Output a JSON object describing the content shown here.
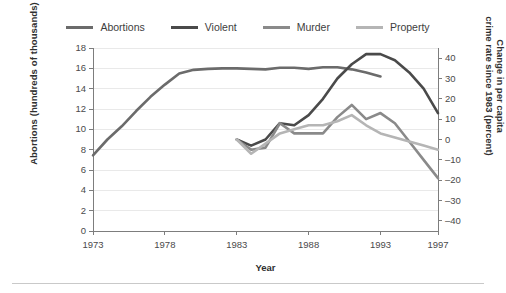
{
  "chart_data": {
    "type": "line",
    "title": "",
    "xlabel": "Year",
    "ylabel": "Abortions (hundreds of thousands)",
    "ylabel_right_line1": "Change in per capita",
    "ylabel_right_line2": "crime rate since 1983 (percent)",
    "grid": true,
    "legend_position": "top",
    "xlim": [
      1973,
      1997
    ],
    "xticks": [
      1973,
      1978,
      1983,
      1988,
      1993,
      1997
    ],
    "xticklabels": [
      "1973",
      "1978",
      "1983",
      "1988",
      "1993",
      "1997"
    ],
    "ylim_left": [
      0,
      18
    ],
    "yticks_left": [
      0,
      2,
      4,
      6,
      8,
      10,
      12,
      14,
      16,
      18
    ],
    "yticklabels_left": [
      "0",
      "2",
      "4",
      "6",
      "8",
      "10",
      "12",
      "14",
      "16",
      "18"
    ],
    "ylim_right": [
      -45,
      45
    ],
    "yticks_right": [
      40,
      30,
      20,
      10,
      0,
      -10,
      -20,
      -30,
      -40
    ],
    "yticklabels_right": [
      "40",
      "30",
      "20",
      "10",
      "0",
      "–10",
      "–20",
      "–30",
      "–40"
    ],
    "series": [
      {
        "name": "Abortions",
        "axis": "left",
        "color": "#6b6b6b",
        "width": 2.6,
        "x": [
          1973,
          1974,
          1975,
          1976,
          1977,
          1978,
          1979,
          1980,
          1981,
          1982,
          1983,
          1984,
          1985,
          1986,
          1987,
          1988,
          1989,
          1990,
          1991,
          1992,
          1993
        ],
        "y": [
          7.45,
          9.0,
          10.3,
          11.8,
          13.2,
          14.4,
          15.5,
          15.85,
          15.95,
          16.0,
          16.0,
          15.95,
          15.9,
          16.05,
          16.05,
          15.95,
          16.1,
          16.1,
          15.9,
          15.6,
          15.2
        ]
      },
      {
        "name": "Violent",
        "axis": "right",
        "color": "#4a4a4a",
        "width": 2.6,
        "x": [
          1983,
          1984,
          1985,
          1986,
          1987,
          1988,
          1989,
          1990,
          1991,
          1992,
          1993,
          1994,
          1995,
          1996,
          1997
        ],
        "y": [
          0,
          -3,
          0,
          8,
          7,
          12,
          20,
          30,
          37,
          42,
          42,
          39,
          33,
          25,
          13
        ]
      },
      {
        "name": "Murder",
        "axis": "right",
        "color": "#8a8a8a",
        "width": 2.6,
        "x": [
          1983,
          1984,
          1985,
          1986,
          1987,
          1988,
          1989,
          1990,
          1991,
          1992,
          1993,
          1994,
          1995,
          1996,
          1997
        ],
        "y": [
          0,
          -5,
          -4,
          8,
          3,
          3,
          3,
          11,
          17,
          10,
          13,
          8,
          -1,
          -10,
          -19
        ]
      },
      {
        "name": "Property",
        "axis": "right",
        "color": "#b5b5b5",
        "width": 2.6,
        "x": [
          1983,
          1984,
          1985,
          1986,
          1987,
          1988,
          1989,
          1990,
          1991,
          1992,
          1993,
          1994,
          1995,
          1996,
          1997
        ],
        "y": [
          0,
          -7,
          -2,
          3,
          5,
          7,
          7,
          9,
          12,
          7,
          3,
          1,
          -1,
          -3,
          -5
        ]
      }
    ]
  },
  "legend": {
    "items": [
      {
        "label": "Abortions",
        "color": "#6b6b6b"
      },
      {
        "label": "Violent",
        "color": "#4a4a4a"
      },
      {
        "label": "Murder",
        "color": "#8a8a8a"
      },
      {
        "label": "Property",
        "color": "#b5b5b5"
      }
    ]
  }
}
